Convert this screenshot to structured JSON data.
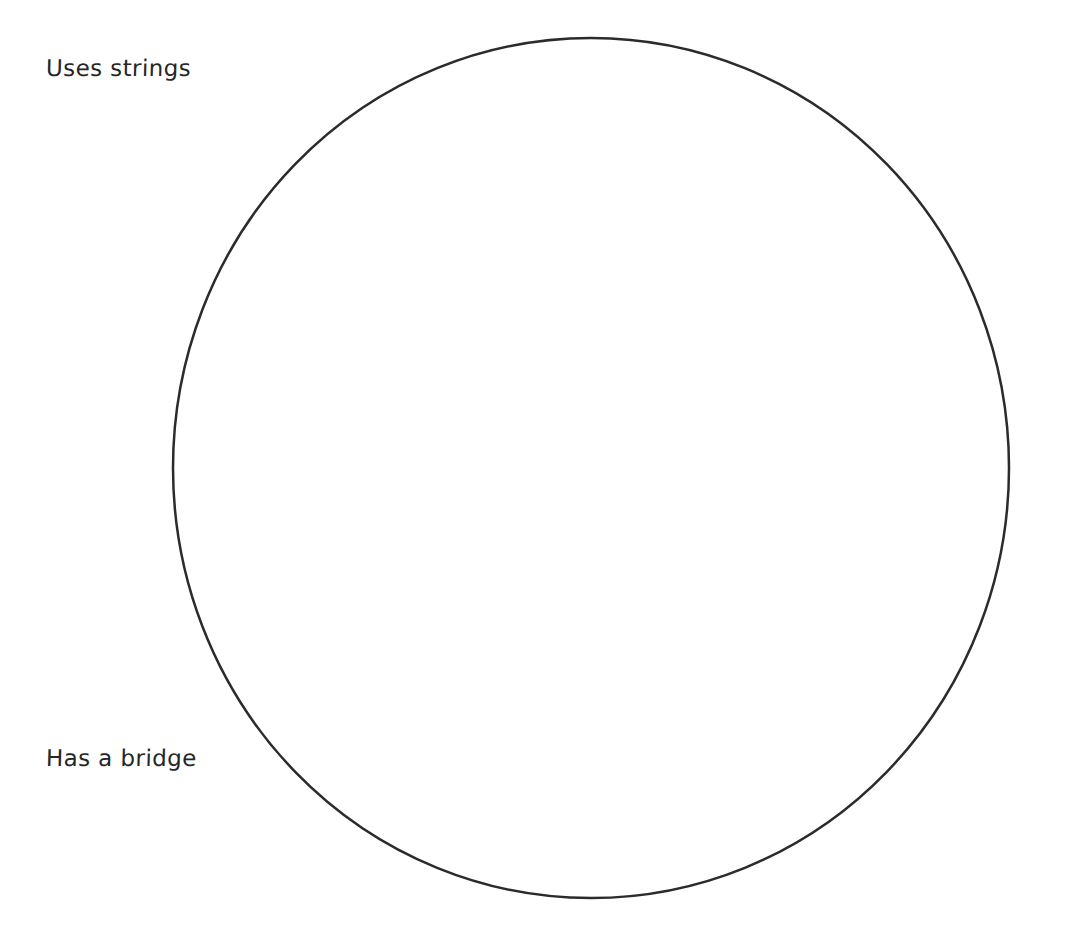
{
  "page": {
    "background_color": "#ffffff",
    "width": 1092,
    "height": 931
  },
  "diagram": {
    "type": "venn-diagram",
    "shape": "circle",
    "stroke_color": "#2b2b2b",
    "fill": "none",
    "stroke_width": 2.5,
    "center_x": 591,
    "center_y": 468,
    "radius_x": 418,
    "radius_y": 430,
    "contents": []
  },
  "labels": {
    "top_left": {
      "text": "Uses strings",
      "x": 46,
      "y": 57,
      "color": "#262626"
    },
    "lower_left": {
      "text": "Has a bridge",
      "x": 46,
      "y": 747,
      "color": "#262626"
    }
  }
}
